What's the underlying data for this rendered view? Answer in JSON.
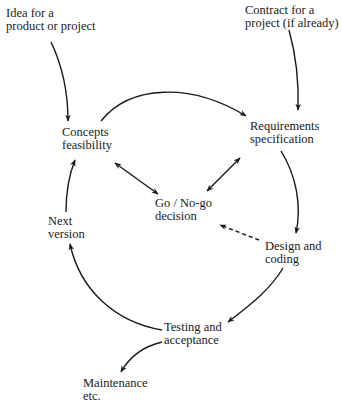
{
  "diagram": {
    "type": "software lifecycle cycle diagram",
    "nodes": {
      "idea": {
        "line1": "Idea for a",
        "line2": "product or project"
      },
      "contract": {
        "line1": "Contract for a",
        "line2": "project (if already)"
      },
      "concepts": {
        "line1": "Concepts",
        "line2": "feasibility"
      },
      "requirements": {
        "line1": "Requirements",
        "line2": "specification"
      },
      "go_nogo": {
        "line1": "Go / No-go",
        "line2": "decision"
      },
      "design": {
        "line1": "Design and",
        "line2": "coding"
      },
      "testing": {
        "line1": "Testing and",
        "line2": "acceptance"
      },
      "next_version": {
        "line1": "Next",
        "line2": "version"
      },
      "maintenance": {
        "line1": "Maintenance",
        "line2": "etc."
      }
    },
    "edges": [
      {
        "from": "idea",
        "to": "concepts",
        "style": "solid"
      },
      {
        "from": "contract",
        "to": "requirements",
        "style": "solid"
      },
      {
        "from": "concepts",
        "to": "requirements",
        "style": "solid"
      },
      {
        "from": "requirements",
        "to": "design",
        "style": "solid"
      },
      {
        "from": "design",
        "to": "testing",
        "style": "solid"
      },
      {
        "from": "testing",
        "to": "next_version",
        "style": "solid"
      },
      {
        "from": "next_version",
        "to": "concepts",
        "style": "solid"
      },
      {
        "from": "concepts",
        "to": "go_nogo",
        "style": "solid",
        "bidirectional": true
      },
      {
        "from": "go_nogo",
        "to": "requirements",
        "style": "solid",
        "bidirectional": true
      },
      {
        "from": "design",
        "to": "go_nogo",
        "style": "dashed"
      },
      {
        "from": "testing",
        "to": "maintenance",
        "style": "solid"
      }
    ],
    "colors": {
      "line": "#1a1a1a",
      "background": "#ffffff"
    }
  }
}
